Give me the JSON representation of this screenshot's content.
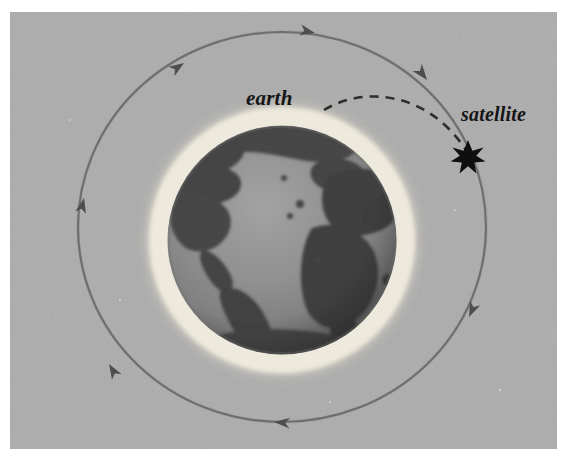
{
  "figure": {
    "caption_labels": {
      "earth": "earth",
      "satellite": "satellite"
    },
    "background_color": "#a8a8a8",
    "paper_color": "#ffffff",
    "ink_color": "#4a4a4a",
    "halo_color": "#efeade",
    "ocean_color": "#8f8f8f",
    "land_color": "#3a3a3a",
    "star_color": "#101010"
  },
  "elements": {
    "earth_label": "earth",
    "satellite_label": "satellite",
    "orbit_name": "orbit-path",
    "leader_name": "earth-leader-line",
    "satellite_marker": "satellite-star-icon",
    "globe_name": "earth-globe",
    "halo_name": "atmosphere-halo"
  },
  "geometry": {
    "image_width": 567,
    "image_height": 464,
    "plate_x": 10,
    "plate_y": 12,
    "plate_width": 547,
    "plate_height": 437,
    "orbit_center_x": 282,
    "orbit_center_y": 227,
    "orbit_rx": 204,
    "orbit_ry": 195,
    "globe_center_x": 282,
    "globe_center_y": 240,
    "globe_radius": 114,
    "halo_radius": 138,
    "satellite_x": 468,
    "satellite_y": 157,
    "orbit_direction": "clockwise",
    "arrow_count": 6
  },
  "arrows": [
    {
      "name": "orbit-arrow-top-left",
      "x": 183,
      "y": 62,
      "angle": -38
    },
    {
      "name": "orbit-arrow-top-right",
      "x": 312,
      "y": 32,
      "angle": 18
    },
    {
      "name": "orbit-arrow-upper-right",
      "x": 425,
      "y": 78,
      "angle": 52
    },
    {
      "name": "orbit-arrow-lower-right",
      "x": 470,
      "y": 318,
      "angle": 118
    },
    {
      "name": "orbit-arrow-bottom",
      "x": 283,
      "y": 422,
      "angle": 182
    },
    {
      "name": "orbit-arrow-lower-left",
      "x": 108,
      "y": 366,
      "angle": 235
    },
    {
      "name": "orbit-arrow-left",
      "x": 84,
      "y": 200,
      "angle": 292
    }
  ]
}
